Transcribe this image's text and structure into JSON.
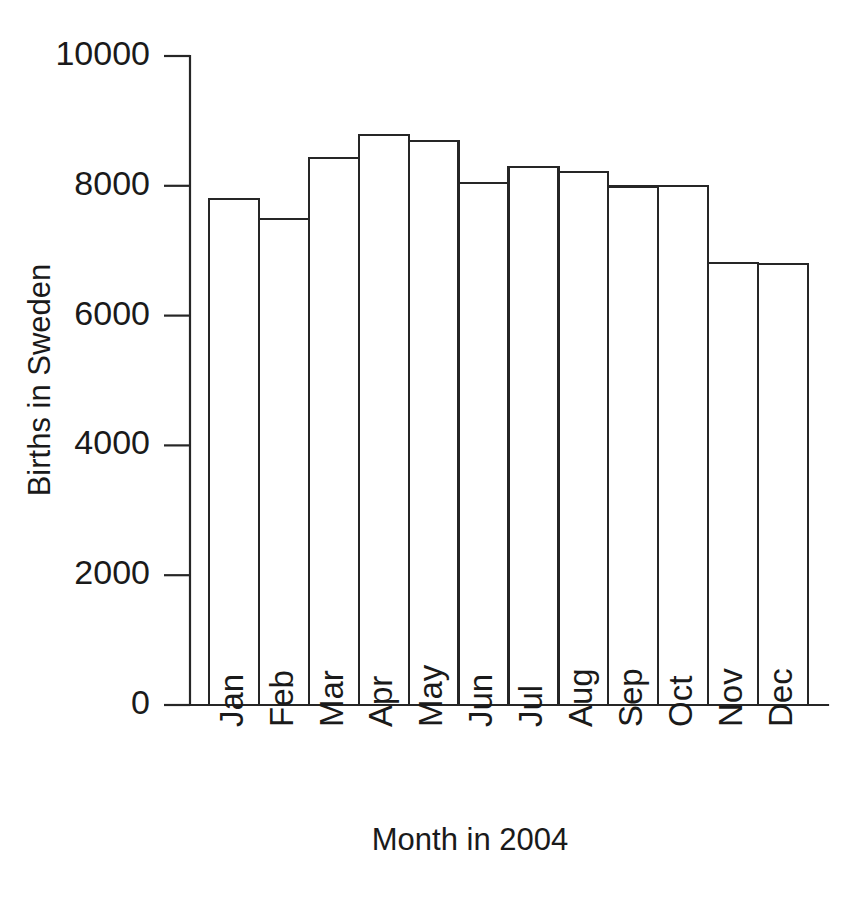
{
  "chart_data": {
    "type": "bar",
    "title": "",
    "xlabel": "Month in 2004",
    "ylabel": "Births in Sweden",
    "categories": [
      "Jan",
      "Feb",
      "Mar",
      "Apr",
      "May",
      "Jun",
      "Jul",
      "Aug",
      "Sep",
      "Oct",
      "Nov",
      "Dec"
    ],
    "values": [
      7800,
      7490,
      8430,
      8780,
      8690,
      8040,
      8290,
      8210,
      7990,
      7995,
      6810,
      6790
    ],
    "ylim": [
      0,
      10000
    ],
    "ytick_labels": [
      "0",
      "2000",
      "4000",
      "6000",
      "8000",
      "10000"
    ],
    "ytick_values": [
      0,
      2000,
      4000,
      6000,
      8000,
      10000
    ],
    "grid": false,
    "legend": "none",
    "bar_fill_color": "#ffffff",
    "bar_stroke_color": "#262626",
    "xtick_label_rotation": -90
  }
}
